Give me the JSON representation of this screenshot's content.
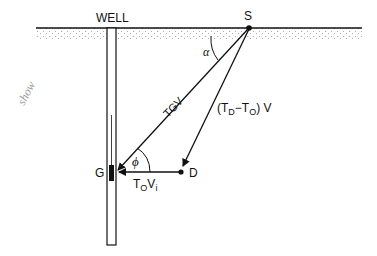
{
  "diagram": {
    "labels": {
      "well": "WELL",
      "source": "S",
      "geophone": "G",
      "point_d": "D",
      "alpha": "α",
      "phi": "ϕ",
      "tgv": "TGV",
      "td_to_v_open": "(T",
      "td_sub": "D",
      "td_minus": "−T",
      "to_sub": "O",
      "td_to_v_close": ") V",
      "tovi_t": "T",
      "tovi_o": "O",
      "tovi_v": "V",
      "tovi_i": "i",
      "handwritten_note": "show"
    },
    "colors": {
      "ink": "#111111",
      "ground_stipple": "#9a9a9a",
      "background": "#ffffff"
    }
  }
}
